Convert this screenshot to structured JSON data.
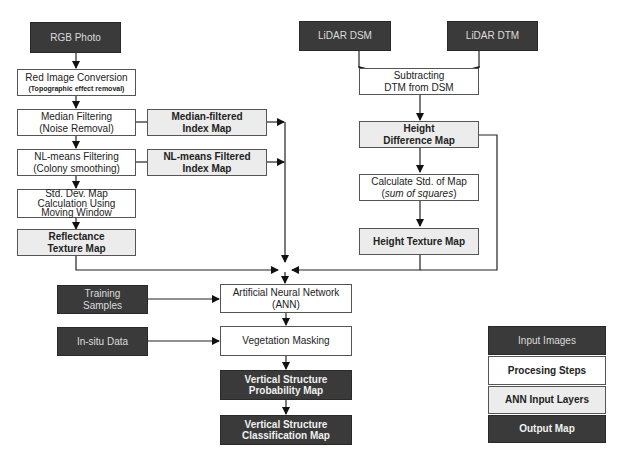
{
  "diagram": {
    "left_branch": {
      "rgb_photo": "RGB Photo",
      "red_image": {
        "line1": "Red Image Conversion",
        "line2": "(Topographic effect removal)"
      },
      "median_filtering": {
        "line1": "Median Filtering",
        "line2": "(Noise Removal)"
      },
      "median_filtered_map": {
        "line1": "Median-filtered",
        "line2": "Index  Map"
      },
      "nlmeans_filtering": {
        "line1": "NL-means Filtering",
        "line2": "(Colony smoothing)"
      },
      "nlmeans_filtered_map": {
        "line1": "NL-means Filtered",
        "line2": "Index Map"
      },
      "std_dev": {
        "line1": "Std. Dev. Map",
        "line2": "Calculation Using",
        "line3": "Moving Window"
      },
      "reflectance_texture": {
        "line1": "Reflectance",
        "line2": "Texture Map"
      }
    },
    "right_branch": {
      "lidar_dsm": "LiDAR DSM",
      "lidar_dtm": "LiDAR DTM",
      "subtracting": {
        "line1": "Subtracting",
        "line2": "DTM  from DSM"
      },
      "height_difference": {
        "line1": "Height",
        "line2": "Difference Map"
      },
      "calc_std": {
        "line1": "Calculate Std. of Map",
        "line2_pre": "(",
        "line2_ital": "sum of squares",
        "line2_post": ")"
      },
      "height_texture": "Height  Texture Map"
    },
    "bottom": {
      "training_samples": {
        "line1": "Training",
        "line2": "Samples"
      },
      "insitu_data": "In-situ Data",
      "ann": {
        "line1": "Artificial Neural Network",
        "line2": "(ANN)"
      },
      "vegetation_masking": "Vegetation Masking",
      "probability_map": {
        "line1": "Vertical Structure",
        "line2": "Probability Map"
      },
      "classification_map": {
        "line1": "Vertical Structure",
        "line2": "Classification Map"
      }
    },
    "legend": {
      "items": [
        {
          "label": "Input Images",
          "kind": "input"
        },
        {
          "label": "Procesing Steps",
          "kind": "proc"
        },
        {
          "label": "ANN Input Layers",
          "kind": "ann"
        },
        {
          "label": "Output Map",
          "kind": "out"
        }
      ]
    },
    "colors": {
      "input_fill": "#3a3a3a",
      "process_fill": "#ffffff",
      "ann_layer_fill": "#ececec",
      "output_fill": "#3a3a3a",
      "line": "#222222"
    }
  }
}
